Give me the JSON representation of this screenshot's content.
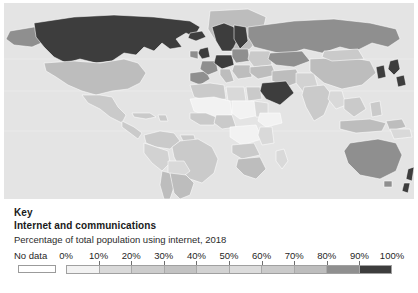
{
  "key_panel": {
    "heading": "Key",
    "title": "Internet and communications",
    "subtitle": "Percentage of total population using internet, 2018",
    "no_data_label": "No data",
    "no_data_color": "#ffffff"
  },
  "chart_data": {
    "type": "heatmap",
    "title": "Internet and communications",
    "subtitle": "Percentage of total population using internet, 2018",
    "xlabel": "",
    "ylabel": "",
    "legend_position": "bottom",
    "grid": false,
    "units": "percent",
    "tick_labels": [
      "0%",
      "10%",
      "20%",
      "30%",
      "40%",
      "50%",
      "60%",
      "70%",
      "80%",
      "90%",
      "100%"
    ],
    "tick_values": [
      0,
      10,
      20,
      30,
      40,
      50,
      60,
      70,
      80,
      90,
      100
    ],
    "bins": [
      {
        "range": "0-10",
        "color": "#f2f2f2"
      },
      {
        "range": "10-20",
        "color": "#d9d9d9"
      },
      {
        "range": "20-30",
        "color": "#cccccc"
      },
      {
        "range": "30-40",
        "color": "#c2c2c2"
      },
      {
        "range": "40-50",
        "color": "#d2d2d2"
      },
      {
        "range": "50-60",
        "color": "#dcdcdc"
      },
      {
        "range": "60-70",
        "color": "#cacaca"
      },
      {
        "range": "70-80",
        "color": "#bdbdbd"
      },
      {
        "range": "80-90",
        "color": "#8f8f8f"
      },
      {
        "range": "90-100",
        "color": "#3d3d3d"
      }
    ],
    "no_data_color": "#ffffff",
    "ocean_color": "#e4e4e4",
    "border_color": "#ffffff",
    "regions": [
      {
        "name": "Canada",
        "value": 93
      },
      {
        "name": "United States",
        "value": 75
      },
      {
        "name": "Greenland",
        "value": 69
      },
      {
        "name": "Mexico",
        "value": 66
      },
      {
        "name": "Brazil",
        "value": 67
      },
      {
        "name": "Argentina",
        "value": 74
      },
      {
        "name": "Chile",
        "value": 82
      },
      {
        "name": "Peru",
        "value": 52
      },
      {
        "name": "Colombia",
        "value": 64
      },
      {
        "name": "Venezuela",
        "value": 64
      },
      {
        "name": "Bolivia",
        "value": 44
      },
      {
        "name": "Norway",
        "value": 96
      },
      {
        "name": "Sweden",
        "value": 92
      },
      {
        "name": "Finland",
        "value": 89
      },
      {
        "name": "Denmark",
        "value": 97
      },
      {
        "name": "United Kingdom",
        "value": 95
      },
      {
        "name": "Ireland",
        "value": 85
      },
      {
        "name": "Germany",
        "value": 87
      },
      {
        "name": "France",
        "value": 82
      },
      {
        "name": "Spain",
        "value": 86
      },
      {
        "name": "Portugal",
        "value": 75
      },
      {
        "name": "Italy",
        "value": 74
      },
      {
        "name": "Poland",
        "value": 78
      },
      {
        "name": "Ukraine",
        "value": 59
      },
      {
        "name": "Russia",
        "value": 81
      },
      {
        "name": "Turkey",
        "value": 71
      },
      {
        "name": "Saudi Arabia",
        "value": 93
      },
      {
        "name": "Iran",
        "value": 70
      },
      {
        "name": "Iraq",
        "value": 49
      },
      {
        "name": "Egypt",
        "value": 47
      },
      {
        "name": "Algeria",
        "value": 50
      },
      {
        "name": "Libya",
        "value": 22
      },
      {
        "name": "Nigeria",
        "value": 42
      },
      {
        "name": "Ethiopia",
        "value": 19
      },
      {
        "name": "Kenya",
        "value": 18
      },
      {
        "name": "Sudan",
        "value": 31
      },
      {
        "name": "Chad",
        "value": 6
      },
      {
        "name": "Niger",
        "value": 5
      },
      {
        "name": "Democratic Republic of the Congo",
        "value": 9
      },
      {
        "name": "South Africa",
        "value": 56
      },
      {
        "name": "Madagascar",
        "value": 10
      },
      {
        "name": "India",
        "value": 34
      },
      {
        "name": "China",
        "value": 54
      },
      {
        "name": "Mongolia",
        "value": 47
      },
      {
        "name": "Kazakhstan",
        "value": 79
      },
      {
        "name": "Japan",
        "value": 91
      },
      {
        "name": "South Korea",
        "value": 96
      },
      {
        "name": "Indonesia",
        "value": 40
      },
      {
        "name": "Australia",
        "value": 87
      },
      {
        "name": "New Zealand",
        "value": 91
      },
      {
        "name": "Pakistan",
        "value": 16
      },
      {
        "name": "Bangladesh",
        "value": 15
      },
      {
        "name": "Thailand",
        "value": 57
      },
      {
        "name": "Vietnam",
        "value": 70
      }
    ]
  }
}
